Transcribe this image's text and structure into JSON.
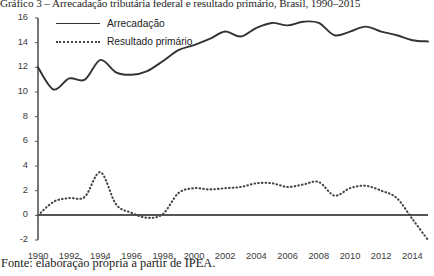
{
  "figure": {
    "title": "Gráfico 3 – Arrecadação tributária federal e resultado primário, Brasil, 1990–2015",
    "source": "Fonte: elaboração própria a partir de IPEA."
  },
  "legend": {
    "position": "top-left",
    "items": [
      {
        "label": "Arrecadação",
        "style": "solid",
        "color": "#333333"
      },
      {
        "label": "Resultado primário",
        "style": "dotted",
        "color": "#444444"
      }
    ]
  },
  "axes": {
    "y_ticks": [
      "16",
      "14",
      "12",
      "10",
      "8",
      "6",
      "4",
      "2",
      "0",
      "-2"
    ],
    "x_ticks": [
      "1990",
      "1992",
      "1994",
      "1996",
      "1998",
      "2000",
      "2002",
      "2004",
      "2006",
      "2008",
      "2010",
      "2012",
      "2014"
    ]
  },
  "chart_data": {
    "type": "line",
    "title": "Gráfico 3 – Arrecadação tributária federal e resultado primário, Brasil, 1990–2015",
    "xlabel": "",
    "ylabel": "",
    "xlim": [
      1990,
      2015
    ],
    "ylim": [
      -2,
      16
    ],
    "grid": false,
    "legend_position": "top-left",
    "x": [
      1990,
      1991,
      1992,
      1993,
      1994,
      1995,
      1996,
      1997,
      1998,
      1999,
      2000,
      2001,
      2002,
      2003,
      2004,
      2005,
      2006,
      2007,
      2008,
      2009,
      2010,
      2011,
      2012,
      2013,
      2014,
      2015
    ],
    "series": [
      {
        "name": "Arrecadação",
        "style": "solid",
        "color": "#333333",
        "values": [
          12.0,
          10.2,
          11.1,
          11.0,
          12.6,
          11.6,
          11.4,
          11.7,
          12.5,
          13.4,
          13.8,
          14.3,
          14.9,
          14.5,
          15.2,
          15.6,
          15.4,
          15.7,
          15.6,
          14.6,
          14.9,
          15.3,
          14.9,
          14.6,
          14.2,
          14.1
        ]
      },
      {
        "name": "Resultado primário",
        "style": "dotted",
        "color": "#444444",
        "values": [
          0.0,
          1.1,
          1.4,
          1.5,
          3.5,
          0.9,
          0.2,
          -0.2,
          0.1,
          1.8,
          2.2,
          2.1,
          2.2,
          2.3,
          2.6,
          2.6,
          2.3,
          2.5,
          2.7,
          1.6,
          2.2,
          2.4,
          2.0,
          1.4,
          -0.3,
          -2.0
        ]
      }
    ]
  }
}
